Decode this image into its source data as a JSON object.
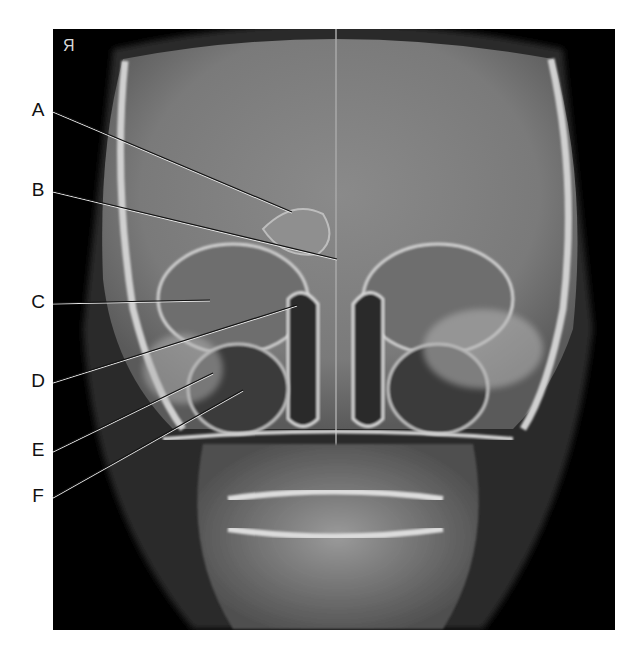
{
  "figure": {
    "orientation_marker": "R",
    "orientation_marker_display": "Я",
    "labels": [
      {
        "letter": "A",
        "x": 38,
        "y": 110,
        "target": [
          292,
          212
        ]
      },
      {
        "letter": "B",
        "x": 38,
        "y": 190,
        "target": [
          337,
          259
        ]
      },
      {
        "letter": "C",
        "x": 38,
        "y": 302,
        "target": [
          210,
          300
        ]
      },
      {
        "letter": "D",
        "x": 38,
        "y": 381,
        "target": [
          297,
          305
        ]
      },
      {
        "letter": "E",
        "x": 38,
        "y": 450,
        "target": [
          213,
          373
        ]
      },
      {
        "letter": "F",
        "x": 38,
        "y": 496,
        "target": [
          243,
          390
        ]
      }
    ]
  }
}
